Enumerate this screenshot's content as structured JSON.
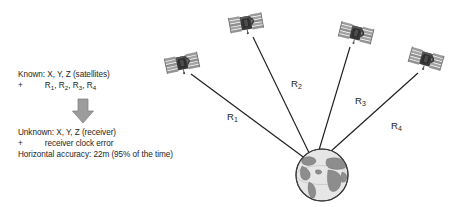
{
  "figure": {
    "title_hidden": "",
    "background_color": "#ffffff"
  },
  "known": {
    "line1": "Known: X, Y, Z (satellites)",
    "plus": "+",
    "r1": "R",
    "r1sub": "1",
    "r2": "R",
    "r2sub": "2",
    "r3": "R",
    "r3sub": "3",
    "r4": "R",
    "r4sub": "4",
    "comma": ", "
  },
  "unknown": {
    "line1": "Unknown: X, Y, Z (receiver)",
    "plus": "+",
    "line2": "receiver clock error",
    "line3": "Horizontal accuracy:  22m (95% of the time)"
  },
  "arrow": {
    "direction": "down",
    "color": "#8f8f8f"
  },
  "ranges": [
    {
      "id": "R1",
      "base": "R",
      "sub": "1"
    },
    {
      "id": "R2",
      "base": "R",
      "sub": "2"
    },
    {
      "id": "R3",
      "base": "R",
      "sub": "3"
    },
    {
      "id": "R4",
      "base": "R",
      "sub": "4"
    }
  ],
  "satellites": [
    {
      "name": "satellite-1",
      "x": 182,
      "y": 63
    },
    {
      "name": "satellite-2",
      "x": 246,
      "y": 23
    },
    {
      "name": "satellite-3",
      "x": 356,
      "y": 33
    },
    {
      "name": "satellite-4",
      "x": 426,
      "y": 59
    }
  ],
  "receiver": {
    "name": "earth-globe",
    "cx": 322,
    "cy": 175,
    "r": 26
  },
  "colors": {
    "line": "#1d1d1d",
    "globe_ocean": "#e3e3e3",
    "globe_land": "#8d8d8d",
    "globe_outline": "#3b3b3b",
    "satellite_body": "#3a3a3a",
    "satellite_panel": "#9a9a9a",
    "text": "#242424"
  }
}
